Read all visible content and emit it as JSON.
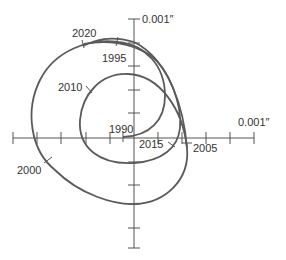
{
  "diagram": {
    "type": "polar-motion-spiral",
    "axis_labels": {
      "y_axis_unit": "0.001″",
      "x_axis_unit": "0.001″"
    },
    "year_labels": [
      {
        "year": "1990",
        "x": 109,
        "y": 133
      },
      {
        "year": "1995",
        "x": 102,
        "y": 62
      },
      {
        "year": "2000",
        "x": 17,
        "y": 174
      },
      {
        "year": "2005",
        "x": 193,
        "y": 152
      },
      {
        "year": "2010",
        "x": 58,
        "y": 91
      },
      {
        "year": "2015",
        "x": 139,
        "y": 148
      },
      {
        "year": "2020",
        "x": 72,
        "y": 37
      }
    ],
    "colors": {
      "curve": "#5a5a5a",
      "axis": "#555555",
      "text": "#333333",
      "background": "#ffffff"
    }
  }
}
